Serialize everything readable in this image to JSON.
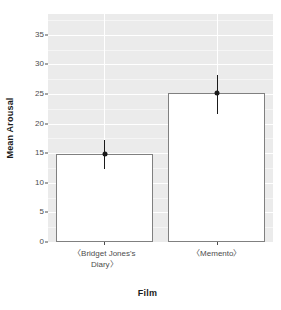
{
  "chart_data": {
    "type": "bar",
    "title": "",
    "xlabel": "Film",
    "ylabel": "Mean Arousal",
    "categories": [
      "〈Bridget Jones's Diary〉",
      "〈Memento〉"
    ],
    "values": [
      14.8,
      25.2
    ],
    "error_bars": [
      {
        "category": "〈Bridget Jones's Diary〉",
        "mean": 14.8,
        "lower": 12.3,
        "upper": 17.3
      },
      {
        "category": "〈Memento〉",
        "mean": 25.2,
        "lower": 21.7,
        "upper": 28.2
      }
    ],
    "ylim": [
      0,
      38.5
    ],
    "y_ticks": [
      0,
      5,
      10,
      15,
      20,
      25,
      30,
      35
    ],
    "y_tick_labels": [
      "0",
      "5",
      "10",
      "15",
      "20",
      "25",
      "30",
      "35"
    ],
    "minor_y_ticks": [
      2.5,
      7.5,
      12.5,
      17.5,
      22.5,
      27.5,
      32.5,
      37.5
    ],
    "grid": true,
    "legend": "none",
    "colors": {
      "panel_background": "#ebebeb",
      "grid_major": "#ffffff",
      "grid_minor": "#f5f5f5",
      "bar_fill": "#ffffff",
      "bar_border": "#808080",
      "error_bar": "#1a1a1a",
      "point": "#1a1a1a",
      "text": "#4d4d4d",
      "title_text": "#1a1a1a"
    }
  },
  "axis": {
    "y_title": "Mean Arousal",
    "x_title": "Film",
    "y_labels": [
      "35",
      "30",
      "25",
      "20",
      "15",
      "10",
      "5",
      "0"
    ],
    "x_labels": [
      "〈Bridget Jones's Diary〉",
      "〈Memento〉"
    ],
    "x_label_lines": [
      [
        "〈Bridget Jones's",
        "Diary〉"
      ],
      [
        "〈Memento〉"
      ]
    ]
  }
}
